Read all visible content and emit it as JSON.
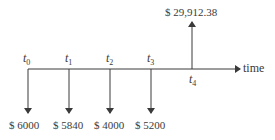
{
  "diagram": {
    "type": "cash-flow-timeline",
    "axis_label": "time",
    "time_points": [
      {
        "symbol": "t",
        "sub": "0",
        "x": 28
      },
      {
        "symbol": "t",
        "sub": "1",
        "x": 69
      },
      {
        "symbol": "t",
        "sub": "2",
        "x": 110
      },
      {
        "symbol": "t",
        "sub": "3",
        "x": 151
      },
      {
        "symbol": "t",
        "sub": "4",
        "x": 192
      }
    ],
    "outflows": [
      {
        "time": "t0",
        "label": "$ 6000"
      },
      {
        "time": "t1",
        "label": "$ 5840"
      },
      {
        "time": "t2",
        "label": "$ 4000"
      },
      {
        "time": "t3",
        "label": "$ 5200"
      }
    ],
    "inflow": {
      "time": "t4",
      "label": "$ 29,912.38"
    },
    "colors": {
      "ink": "#3a3a3a",
      "background": "#ffffff"
    }
  }
}
